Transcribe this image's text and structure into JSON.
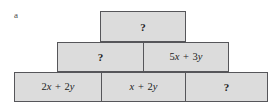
{
  "figure": {
    "part_label": "a",
    "type": "algebra-pyramid",
    "fill_color": "#dcdcdc",
    "border_color": "#56565a",
    "background_color": "#ffffff",
    "text_color": "#1d1d1d",
    "unknown_symbol": "?"
  },
  "rows": {
    "top": {
      "bricks": [
        {
          "text": "?",
          "is_unknown": true
        }
      ]
    },
    "middle": {
      "bricks": [
        {
          "text": "?",
          "is_unknown": true
        },
        {
          "text": "5x + 3y",
          "is_unknown": false
        }
      ]
    },
    "bottom": {
      "bricks": [
        {
          "text": "2x + 2y",
          "is_unknown": false
        },
        {
          "text": "x + 2y",
          "is_unknown": false
        },
        {
          "text": "?",
          "is_unknown": true
        }
      ]
    }
  }
}
